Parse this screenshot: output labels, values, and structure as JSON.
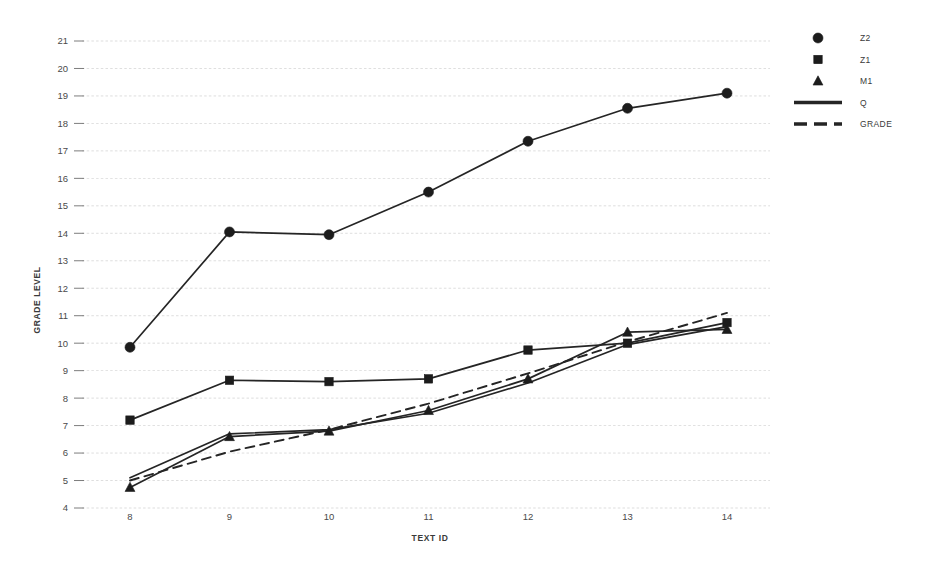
{
  "chart_data": {
    "type": "line",
    "title": "",
    "xlabel": "TEXT ID",
    "ylabel": "GRADE LEVEL",
    "x": [
      8,
      9,
      10,
      11,
      12,
      13,
      14
    ],
    "xtick_labels": [
      "8",
      "9",
      "10",
      "11",
      "12",
      "13",
      "14"
    ],
    "ytick_labels": [
      "4",
      "5",
      "6",
      "7",
      "8",
      "9",
      "10",
      "11",
      "12",
      "13",
      "14",
      "15",
      "16",
      "17",
      "18",
      "19",
      "20",
      "21"
    ],
    "xlim": [
      7.5,
      14.6
    ],
    "ylim": [
      4,
      21
    ],
    "grid": true,
    "legend_position": "right",
    "series": [
      {
        "name": "Z2",
        "marker": "circle",
        "linestyle": "solid",
        "values": [
          9.85,
          14.05,
          13.95,
          15.5,
          17.35,
          18.55,
          19.1
        ]
      },
      {
        "name": "Z1",
        "marker": "square",
        "linestyle": "solid",
        "values": [
          7.2,
          8.65,
          8.6,
          8.7,
          9.75,
          10.0,
          10.75
        ]
      },
      {
        "name": "M1",
        "marker": "triangle",
        "linestyle": "solid",
        "values": [
          4.75,
          6.6,
          6.8,
          7.55,
          8.7,
          10.4,
          10.5
        ]
      },
      {
        "name": "Q",
        "marker": "none",
        "linestyle": "solid",
        "values": [
          5.1,
          6.7,
          6.85,
          7.45,
          8.55,
          9.95,
          10.6
        ]
      },
      {
        "name": "GRADE",
        "marker": "none",
        "linestyle": "dashed",
        "values": [
          5.0,
          6.05,
          6.85,
          7.8,
          8.9,
          10.05,
          11.1
        ]
      }
    ]
  },
  "legend": {
    "entries": [
      {
        "label": "Z2",
        "symbol": "circle"
      },
      {
        "label": "Z1",
        "symbol": "square"
      },
      {
        "label": "M1",
        "symbol": "triangle"
      },
      {
        "label": "Q",
        "symbol": "solid-line"
      },
      {
        "label": "GRADE",
        "symbol": "dashed-line"
      }
    ]
  },
  "colors": {
    "ink": "#252525",
    "grid": "#c9c9c9",
    "background": "#ffffff"
  }
}
